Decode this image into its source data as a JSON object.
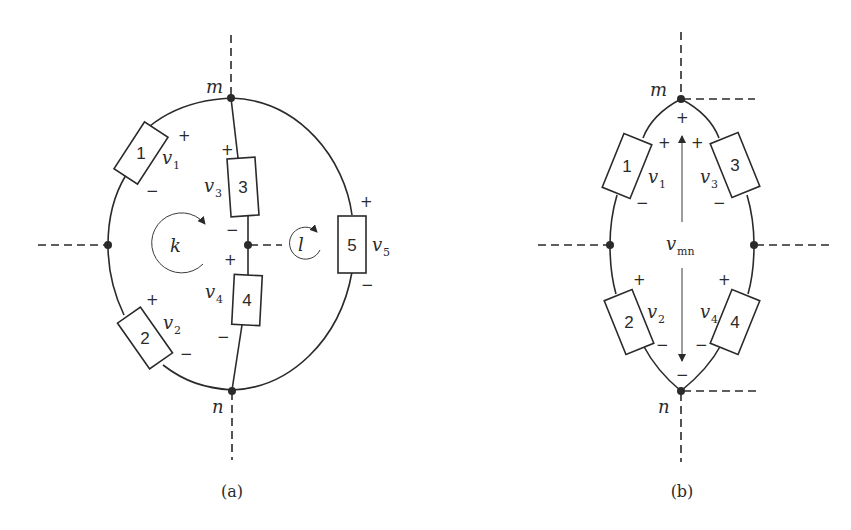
{
  "figure_a": {
    "caption": "(a)",
    "nodes": {
      "top": "m",
      "bottom": "n"
    },
    "elements": [
      {
        "id": "1",
        "voltage": "v",
        "sub": "1",
        "plus": "+",
        "minus": "−"
      },
      {
        "id": "2",
        "voltage": "v",
        "sub": "2",
        "plus": "+",
        "minus": "−"
      },
      {
        "id": "3",
        "voltage": "v",
        "sub": "3",
        "plus": "+",
        "minus": "−"
      },
      {
        "id": "4",
        "voltage": "v",
        "sub": "4",
        "plus": "+",
        "minus": "−"
      },
      {
        "id": "5",
        "voltage": "v",
        "sub": "5",
        "plus": "+",
        "minus": "−"
      }
    ],
    "loops": [
      {
        "label": "k"
      },
      {
        "label": "l"
      }
    ]
  },
  "figure_b": {
    "caption": "(b)",
    "nodes": {
      "top": "m",
      "bottom": "n"
    },
    "elements": [
      {
        "id": "1",
        "voltage": "v",
        "sub": "1",
        "plus": "+",
        "minus": "−"
      },
      {
        "id": "2",
        "voltage": "v",
        "sub": "2",
        "plus": "+",
        "minus": "−"
      },
      {
        "id": "3",
        "voltage": "v",
        "sub": "3",
        "plus": "+",
        "minus": "−"
      },
      {
        "id": "4",
        "voltage": "v",
        "sub": "4",
        "plus": "+",
        "minus": "−"
      }
    ],
    "vmn": {
      "voltage": "v",
      "sub": "mn",
      "plus": "+",
      "minus": "−"
    }
  }
}
